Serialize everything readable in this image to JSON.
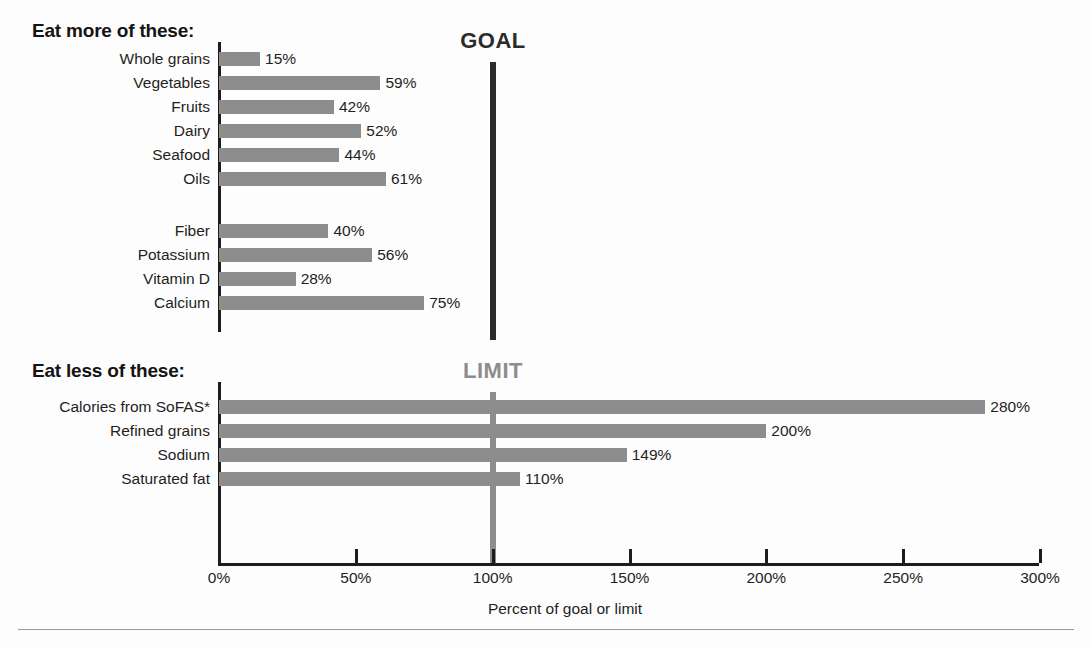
{
  "sections": {
    "more_heading": "Eat more of these:",
    "less_heading": "Eat less of these:"
  },
  "markers": {
    "goal_label": "GOAL",
    "limit_label": "LIMIT",
    "goal_value": 100,
    "limit_value": 100,
    "goal_color": "#2b2b2b",
    "limit_color": "#8d8d8d"
  },
  "axis": {
    "title": "Percent of goal or limit",
    "ticks": [
      "0%",
      "50%",
      "100%",
      "150%",
      "200%",
      "250%",
      "300%"
    ],
    "tick_values": [
      0,
      50,
      100,
      150,
      200,
      250,
      300
    ],
    "min": 0,
    "max": 300
  },
  "chart_data": {
    "type": "bar",
    "orientation": "horizontal",
    "title": "",
    "xlabel": "Percent of goal or limit",
    "ylabel": "",
    "xlim": [
      0,
      300
    ],
    "grid": false,
    "legend": false,
    "bar_color": "#8d8d8d",
    "reference_lines": [
      {
        "label": "GOAL",
        "value": 100,
        "group": "eat-more",
        "color": "#2b2b2b"
      },
      {
        "label": "LIMIT",
        "value": 100,
        "group": "eat-less",
        "color": "#8d8d8d"
      }
    ],
    "groups": [
      {
        "name": "Eat more of these:",
        "subgroups": [
          {
            "categories": [
              "Whole grains",
              "Vegetables",
              "Fruits",
              "Dairy",
              "Seafood",
              "Oils"
            ],
            "values": [
              15,
              59,
              42,
              52,
              44,
              61
            ],
            "labels": [
              "15%",
              "59%",
              "42%",
              "52%",
              "44%",
              "61%"
            ]
          },
          {
            "categories": [
              "Fiber",
              "Potassium",
              "Vitamin D",
              "Calcium"
            ],
            "values": [
              40,
              56,
              28,
              75
            ],
            "labels": [
              "40%",
              "56%",
              "28%",
              "75%"
            ]
          }
        ]
      },
      {
        "name": "Eat less of these:",
        "subgroups": [
          {
            "categories": [
              "Calories from SoFAS*",
              "Refined grains",
              "Sodium",
              "Saturated fat"
            ],
            "values": [
              280,
              200,
              149,
              110
            ],
            "labels": [
              "280%",
              "200%",
              "149%",
              "110%"
            ]
          }
        ]
      }
    ],
    "categories": [
      "Whole grains",
      "Vegetables",
      "Fruits",
      "Dairy",
      "Seafood",
      "Oils",
      "Fiber",
      "Potassium",
      "Vitamin D",
      "Calcium",
      "Calories from SoFAS*",
      "Refined grains",
      "Sodium",
      "Saturated fat"
    ],
    "values": [
      15,
      59,
      42,
      52,
      44,
      61,
      40,
      56,
      28,
      75,
      280,
      200,
      149,
      110
    ]
  },
  "rows": [
    {
      "label": "Whole grains",
      "value": 15,
      "text": "15%",
      "top": 52
    },
    {
      "label": "Vegetables",
      "value": 59,
      "text": "59%",
      "top": 76
    },
    {
      "label": "Fruits",
      "value": 42,
      "text": "42%",
      "top": 100
    },
    {
      "label": "Dairy",
      "value": 52,
      "text": "52%",
      "top": 124
    },
    {
      "label": "Seafood",
      "value": 44,
      "text": "44%",
      "top": 148
    },
    {
      "label": "Oils",
      "value": 61,
      "text": "61%",
      "top": 172
    },
    {
      "label": "Fiber",
      "value": 40,
      "text": "40%",
      "top": 224
    },
    {
      "label": "Potassium",
      "value": 56,
      "text": "56%",
      "top": 248
    },
    {
      "label": "Vitamin D",
      "value": 28,
      "text": "28%",
      "top": 272
    },
    {
      "label": "Calcium",
      "value": 75,
      "text": "75%",
      "top": 296
    },
    {
      "label": "Calories from SoFAS*",
      "value": 280,
      "text": "280%",
      "top": 400
    },
    {
      "label": "Refined grains",
      "value": 200,
      "text": "200%",
      "top": 424
    },
    {
      "label": "Sodium",
      "value": 149,
      "text": "149%",
      "top": 448
    },
    {
      "label": "Saturated fat",
      "value": 110,
      "text": "110%",
      "top": 472
    }
  ]
}
